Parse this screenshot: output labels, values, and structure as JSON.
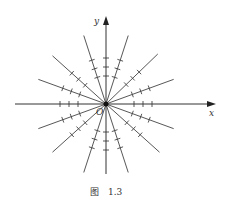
{
  "figure": {
    "x_label": "x",
    "y_label": "y",
    "origin_label": "O",
    "caption": "图　1.3",
    "line_color": "#333333",
    "ray_angles_deg": [
      20,
      44,
      72,
      108,
      138,
      160,
      200,
      222,
      252,
      288,
      318,
      340
    ]
  }
}
